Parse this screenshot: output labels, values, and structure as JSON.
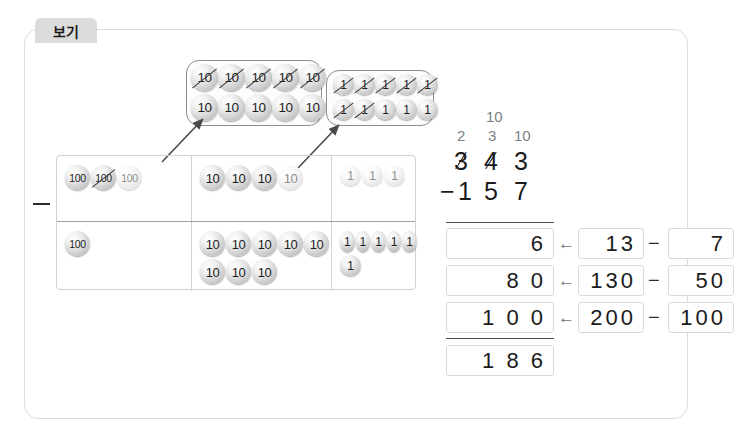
{
  "panel": {
    "tab_label": "보기"
  },
  "top_groups": {
    "tens_group": {
      "name": "ten-rods-expanded",
      "chip_value": "10",
      "rows": [
        {
          "count": 5,
          "crossed": true
        },
        {
          "count": 5,
          "crossed": false
        }
      ]
    },
    "ones_group": {
      "name": "ones-expanded",
      "chip_value": "1",
      "rows": [
        {
          "count": 5,
          "crossed": true
        },
        {
          "count": 2,
          "crossed": true,
          "then_plain": 3
        }
      ]
    }
  },
  "place_value_table": {
    "row1": {
      "hundreds": {
        "value": "100",
        "chips": [
          {
            "crossed": false,
            "faded": false
          },
          {
            "crossed": true,
            "faded": false
          },
          {
            "crossed": false,
            "faded": true
          }
        ]
      },
      "tens": {
        "value": "10",
        "chips": [
          {
            "crossed": false,
            "faded": false
          },
          {
            "crossed": false,
            "faded": false
          },
          {
            "crossed": false,
            "faded": false
          },
          {
            "crossed": false,
            "faded": true
          }
        ]
      },
      "ones": {
        "value": "1",
        "chips": [
          {
            "crossed": false,
            "faded": true
          },
          {
            "crossed": false,
            "faded": true
          },
          {
            "crossed": false,
            "faded": true
          }
        ]
      }
    },
    "row2": {
      "hundreds": {
        "value": "100",
        "count": 1
      },
      "tens": {
        "value": "10",
        "row_a": 5,
        "row_b": 3
      },
      "ones": {
        "value": "1",
        "row_a": 5,
        "row_b": 1
      }
    },
    "operator": "−"
  },
  "vertical_subtraction": {
    "regroup_top": "10",
    "regroup_row": [
      "2",
      "3",
      "10"
    ],
    "minuend": [
      "3",
      "4",
      "3"
    ],
    "minuend_struck": [
      true,
      true,
      false
    ],
    "operator": "−",
    "subtrahend": [
      "1",
      "5",
      "7"
    ]
  },
  "decomposition": {
    "rows": [
      {
        "result": "6",
        "arrow": "←",
        "left": "13",
        "op": "−",
        "right": "7"
      },
      {
        "result": "8 0",
        "arrow": "←",
        "left": "130",
        "op": "−",
        "right": "50"
      },
      {
        "result": "1 0 0",
        "arrow": "←",
        "left": "200",
        "op": "−",
        "right": "100"
      }
    ],
    "total": "1 8 6"
  },
  "colors": {
    "panel_border": "#d9dde1",
    "tab_bg": "#dcdcdc",
    "chip_dark": "#a9a9a9",
    "text": "#1b1b1b",
    "regroup_text": "#7a7f84"
  }
}
